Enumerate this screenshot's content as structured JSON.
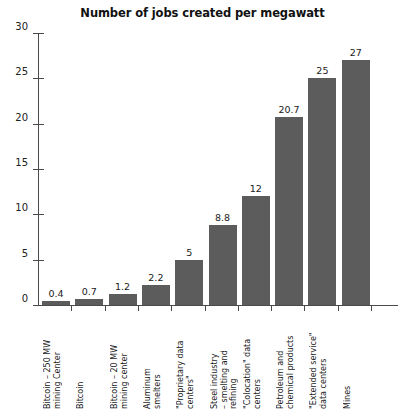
{
  "chart_data": {
    "type": "bar",
    "title": "Number of jobs created per megawatt",
    "xlabel": "",
    "ylabel": "",
    "ylim": [
      0,
      30
    ],
    "yticks": [
      0,
      5,
      10,
      15,
      20,
      25,
      30
    ],
    "grid": false,
    "legend": null,
    "bar_color": "#5c5c5c",
    "categories": [
      "Bitcoin – 250 MW mining Center",
      "Bitcoin",
      "Bitcoin – 20 MW mining center",
      "Aluminum smelters",
      "\"Proprietary data centers\"",
      "Steel industry – smelting and refining",
      "\"Colocation\" data centers",
      "Petroleum and chemical products",
      "\"Extended service\" data centers",
      "Mines"
    ],
    "category_lines": [
      "Bitcoin – 250 MW\nmining Center",
      "Bitcoin",
      "Bitcoin – 20 MW\nmining center",
      "Aluminum\nsmelters",
      "\"Proprietary data\ncenters\"",
      "Steel industry\n– smelting and\nrefining",
      "\"Colocation\" data\ncenters",
      "Petroleum and\nchemical products",
      "\"Extended service\"\ndata centers",
      "Mines"
    ],
    "values": [
      0.4,
      0.7,
      1.2,
      2.2,
      5,
      8.8,
      12,
      20.7,
      25,
      27
    ],
    "value_labels": [
      "0.4",
      "0.7",
      "1.2",
      "2.2",
      "5",
      "8.8",
      "12",
      "20.7",
      "25",
      "27"
    ]
  }
}
